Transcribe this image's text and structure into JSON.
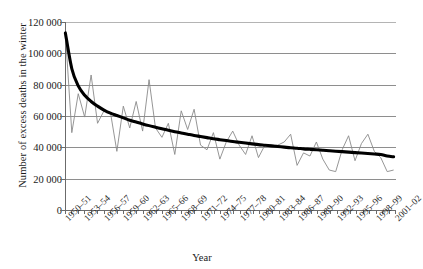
{
  "chart_data": {
    "type": "line",
    "title": "",
    "xlabel": "Year",
    "ylabel": "Number of excess deaths in the winter",
    "ylim": [
      0,
      120000
    ],
    "yticks": [
      0,
      20000,
      40000,
      60000,
      80000,
      100000,
      120000
    ],
    "ytick_labels": [
      "0",
      "20 000",
      "40 000",
      "60 000",
      "80 000",
      "100 000",
      "120 000"
    ],
    "grid": "horizontal",
    "legend": "none",
    "x": [
      "1950-51",
      "1951-52",
      "1952-53",
      "1953-54",
      "1954-55",
      "1955-56",
      "1956-57",
      "1957-58",
      "1958-59",
      "1959-60",
      "1960-61",
      "1961-62",
      "1962-63",
      "1963-64",
      "1964-65",
      "1965-66",
      "1966-67",
      "1967-68",
      "1968-69",
      "1969-70",
      "1970-71",
      "1971-72",
      "1972-73",
      "1973-74",
      "1974-75",
      "1975-76",
      "1976-77",
      "1977-78",
      "1978-79",
      "1979-80",
      "1980-81",
      "1981-82",
      "1982-83",
      "1983-84",
      "1984-85",
      "1985-86",
      "1986-87",
      "1987-88",
      "1988-89",
      "1989-90",
      "1990-91",
      "1991-92",
      "1992-93",
      "1993-94",
      "1994-95",
      "1995-96",
      "1996-97",
      "1997-98",
      "1998-99",
      "1999-00",
      "2000-01",
      "2001-02"
    ],
    "xtick_labels": [
      "1950–51",
      "1953–54",
      "1956–57",
      "1959–60",
      "1962–63",
      "1965–66",
      "1968–69",
      "1971–72",
      "1974–75",
      "1977–78",
      "1980–81",
      "1983–84",
      "1986–87",
      "1989–90",
      "1992–93",
      "1995–96",
      "1998–99",
      "2001–02"
    ],
    "xtick_indices": [
      0,
      3,
      6,
      9,
      12,
      15,
      18,
      21,
      24,
      27,
      30,
      33,
      36,
      39,
      42,
      45,
      48,
      51
    ],
    "series": [
      {
        "name": "Annual excess winter deaths",
        "style": "thin-grey-line",
        "color": "#8a8a8a",
        "values": [
          113000,
          49000,
          74000,
          59000,
          86000,
          55000,
          63000,
          62000,
          37000,
          66000,
          52000,
          69000,
          50000,
          83000,
          52000,
          46000,
          55000,
          35000,
          63000,
          51000,
          64000,
          41000,
          38000,
          49000,
          32000,
          43000,
          50000,
          41000,
          35000,
          47000,
          33000,
          41000,
          41000,
          41000,
          43000,
          48000,
          28000,
          36000,
          34000,
          43000,
          32000,
          25000,
          24000,
          38000,
          47000,
          31000,
          42000,
          48000,
          37000,
          33000,
          24000,
          25000
        ]
      },
      {
        "name": "Trend (smoothed)",
        "style": "thick-black-curve",
        "color": "#000000",
        "values": [
          113000,
          90000,
          79000,
          73000,
          69000,
          66000,
          63500,
          61500,
          60000,
          58500,
          57000,
          55800,
          54600,
          53500,
          52500,
          51500,
          50500,
          49600,
          48800,
          48000,
          47200,
          46500,
          45800,
          45100,
          44500,
          43900,
          43300,
          42800,
          42300,
          41800,
          41300,
          40900,
          40500,
          40100,
          39700,
          39300,
          39000,
          38600,
          38300,
          38000,
          37700,
          37400,
          37100,
          36800,
          36500,
          36200,
          35900,
          35600,
          35300,
          35000,
          34000,
          33500
        ]
      }
    ]
  }
}
